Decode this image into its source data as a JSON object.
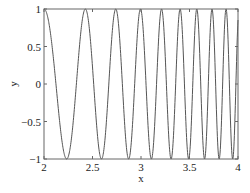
{
  "chart_data": {
    "type": "line",
    "title": "",
    "xlabel": "x",
    "ylabel": "y",
    "xlim": [
      2,
      4
    ],
    "ylim": [
      -1,
      1
    ],
    "grid": false,
    "legend": null,
    "xticks": [
      2,
      2.5,
      3,
      3.5,
      4
    ],
    "xtick_labels": [
      "2",
      "2.5",
      "3",
      "3.5",
      "4"
    ],
    "yticks": [
      -1,
      -0.5,
      0,
      0.5,
      1
    ],
    "ytick_labels": [
      "−1",
      "−0.5",
      "0",
      "0.5",
      "1"
    ],
    "function": "y = cos(x^3 - 8)",
    "series": [
      {
        "name": "y",
        "color": "#555555",
        "x": [
          2.0,
          2.05,
          2.1,
          2.15,
          2.2,
          2.25,
          2.3,
          2.35,
          2.4,
          2.45,
          2.5,
          2.55,
          2.6,
          2.65,
          2.7,
          2.75,
          2.8,
          2.85,
          2.9,
          2.95,
          3.0,
          3.05,
          3.1,
          3.15,
          3.2,
          3.25,
          3.3,
          3.35,
          3.4,
          3.45,
          3.5,
          3.55,
          3.6,
          3.65,
          3.7,
          3.75,
          3.8,
          3.85,
          3.9,
          3.95,
          4.0
        ],
        "y": [
          1.0,
          0.85,
          0.43,
          -0.16,
          -0.72,
          -0.99,
          -0.86,
          -0.32,
          0.36,
          0.89,
          0.96,
          0.42,
          -0.38,
          -0.95,
          -0.84,
          -0.06,
          0.8,
          0.93,
          0.13,
          -0.85,
          -0.75,
          0.28,
          0.99,
          0.35,
          -0.81,
          -0.76,
          0.43,
          0.96,
          -0.14,
          -0.99,
          0.18,
          0.98,
          -0.24,
          -0.96,
          0.45,
          0.76,
          -0.86,
          -0.24,
          1.0,
          -0.55,
          0.85
        ]
      }
    ]
  }
}
